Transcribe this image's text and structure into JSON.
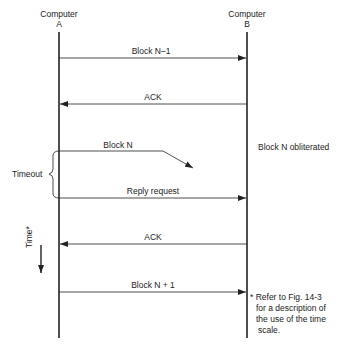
{
  "nodes": {
    "a": {
      "line1": "Computer",
      "line2": "A"
    },
    "b": {
      "line1": "Computer",
      "line2": "B"
    }
  },
  "messages": [
    {
      "label": "Block N–1",
      "direction": "A-to-B"
    },
    {
      "label": "ACK",
      "direction": "B-to-A"
    },
    {
      "label": "Block N",
      "direction": "A-to-B",
      "status": "lost"
    },
    {
      "label": "Reply request",
      "direction": "A-to-B"
    },
    {
      "label": "ACK",
      "direction": "B-to-A"
    },
    {
      "label": "Block N + 1",
      "direction": "A-to-B"
    }
  ],
  "annotations": {
    "obliterated": "Block N obliterated",
    "timeout": "Timeout",
    "time_axis": "Time*",
    "footnote": [
      "* Refer to Fig. 14-3",
      "for a description of",
      "the use of the time",
      "scale."
    ]
  }
}
